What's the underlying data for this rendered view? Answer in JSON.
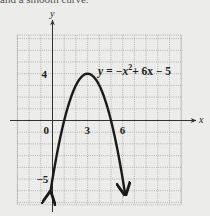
{
  "caption": "and a smooth curve.",
  "chart_data": {
    "type": "line",
    "title": "",
    "equation_label": "y = −x² + 6x − 5",
    "equation_parts": {
      "lhs": "y = −x",
      "exp": "2",
      "rest": "+ 6x − 5"
    },
    "xlabel": "x",
    "ylabel": "y",
    "xlim": [
      -3,
      11
    ],
    "ylim": [
      -7.2,
      7.3
    ],
    "grid": true,
    "grid_step": 1,
    "x_tick_labels": [
      {
        "value": 0,
        "label": "0"
      },
      {
        "value": 3,
        "label": "3"
      },
      {
        "value": 6,
        "label": "6"
      }
    ],
    "y_tick_labels": [
      {
        "value": 4,
        "label": "4"
      },
      {
        "value": -5,
        "label": "−5"
      }
    ],
    "series": [
      {
        "name": "y = −x² + 6x − 5",
        "function": "-x^2 + 6x - 5",
        "x_range": [
          -0.2,
          6.2
        ],
        "arrows_at_ends": true,
        "key_points": [
          {
            "x": 0,
            "y": -5
          },
          {
            "x": 1,
            "y": 0
          },
          {
            "x": 2,
            "y": 3
          },
          {
            "x": 3,
            "y": 4
          },
          {
            "x": 4,
            "y": 3
          },
          {
            "x": 5,
            "y": 0
          },
          {
            "x": 6,
            "y": -5
          }
        ]
      }
    ],
    "vertex": {
      "x": 3,
      "y": 4
    }
  },
  "style": {
    "background": "#ececea",
    "grid_color": "#9a9a9a",
    "axis_color": "#333333",
    "curve_color": "#1a1a1a"
  }
}
